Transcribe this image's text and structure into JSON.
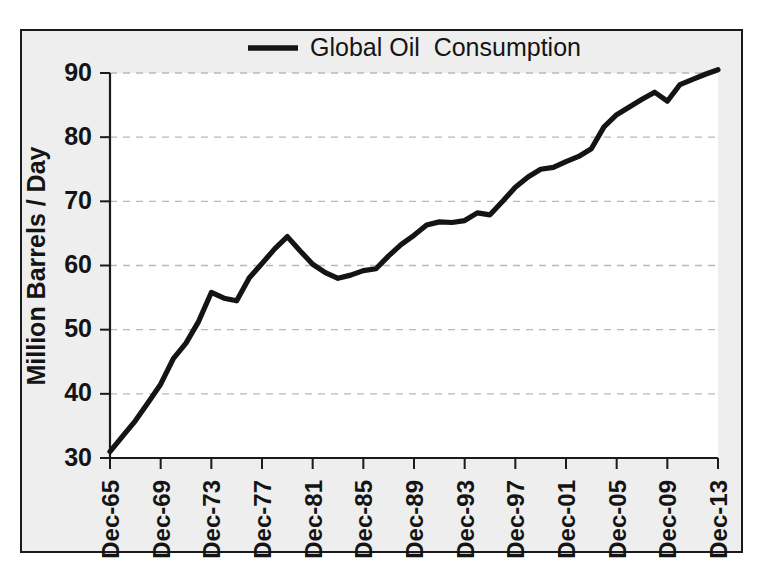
{
  "figure": {
    "background_color": "#eeeeee",
    "plot_background_color": "#ffffff",
    "border_color": "#1a1a1a"
  },
  "legend": {
    "position": "top-center",
    "entries": [
      {
        "label": "Global Oil  Consumption",
        "color": "#141414",
        "marker": "line"
      }
    ]
  },
  "axes": {
    "y_axis_title": "Million Barrels / Day",
    "y_tick_labels": [
      "30",
      "40",
      "50",
      "60",
      "70",
      "80",
      "90"
    ],
    "x_tick_labels": [
      "Dec-65",
      "Dec-69",
      "Dec-73",
      "Dec-77",
      "Dec-81",
      "Dec-85",
      "Dec-89",
      "Dec-93",
      "Dec-97",
      "Dec-01",
      "Dec-05",
      "Dec-09",
      "Dec-13"
    ],
    "x_axis_title": ""
  },
  "chart_data": {
    "type": "line",
    "title": "",
    "subtitle": "",
    "xlabel": "",
    "ylabel": "Million Barrels / Day",
    "ylim": [
      30,
      90
    ],
    "xlim": [
      "Dec-65",
      "Dec-13"
    ],
    "ytick_values": [
      30,
      40,
      50,
      60,
      70,
      80,
      90
    ],
    "xtick_labels": [
      "Dec-65",
      "Dec-69",
      "Dec-73",
      "Dec-77",
      "Dec-81",
      "Dec-85",
      "Dec-89",
      "Dec-93",
      "Dec-97",
      "Dec-01",
      "Dec-05",
      "Dec-09",
      "Dec-13"
    ],
    "grid": "horizontal-dashed",
    "legend_position": "top-center",
    "legend_entries": [
      "Global Oil  Consumption"
    ],
    "x": [
      "Dec-65",
      "Dec-66",
      "Dec-67",
      "Dec-68",
      "Dec-69",
      "Dec-70",
      "Dec-71",
      "Dec-72",
      "Dec-73",
      "Dec-74",
      "Dec-75",
      "Dec-76",
      "Dec-77",
      "Dec-78",
      "Dec-79",
      "Dec-80",
      "Dec-81",
      "Dec-82",
      "Dec-83",
      "Dec-84",
      "Dec-85",
      "Dec-86",
      "Dec-87",
      "Dec-88",
      "Dec-89",
      "Dec-90",
      "Dec-91",
      "Dec-92",
      "Dec-93",
      "Dec-94",
      "Dec-95",
      "Dec-96",
      "Dec-97",
      "Dec-98",
      "Dec-99",
      "Dec-00",
      "Dec-01",
      "Dec-02",
      "Dec-03",
      "Dec-04",
      "Dec-05",
      "Dec-06",
      "Dec-07",
      "Dec-08",
      "Dec-09",
      "Dec-10",
      "Dec-11",
      "Dec-12",
      "Dec-13"
    ],
    "series": [
      {
        "name": "Global Oil  Consumption",
        "color": "#141414",
        "values": [
          31.0,
          33.4,
          35.8,
          38.6,
          41.5,
          45.5,
          47.9,
          51.3,
          55.8,
          54.9,
          54.5,
          58.1,
          60.3,
          62.6,
          64.5,
          62.3,
          60.2,
          58.9,
          58.0,
          58.5,
          59.2,
          59.5,
          61.5,
          63.3,
          64.7,
          66.3,
          66.8,
          66.7,
          67.0,
          68.2,
          67.9,
          70.0,
          72.2,
          73.8,
          75.0,
          75.3,
          76.2,
          77.0,
          78.2,
          81.6,
          83.5,
          84.7,
          85.9,
          87.0,
          85.6,
          88.2,
          89.0,
          89.8,
          90.5
        ]
      }
    ]
  }
}
